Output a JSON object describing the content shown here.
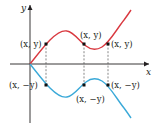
{
  "diagram": {
    "axes": {
      "x_label": "x",
      "y_label": "y"
    },
    "colors": {
      "upper_curve": "#d9383f",
      "lower_curve": "#3aa9d8",
      "axis": "#231f20",
      "guide": "#555555"
    },
    "upper_curve_points_label": "(x, y)",
    "lower_curve_points_label": "(x, −y)",
    "point_labels": {
      "upper": [
        "(x, y)",
        "(x, y)",
        "(x, y)"
      ],
      "lower": [
        "(x, −y)",
        "(x, −y)",
        "(x, −y)"
      ]
    }
  }
}
